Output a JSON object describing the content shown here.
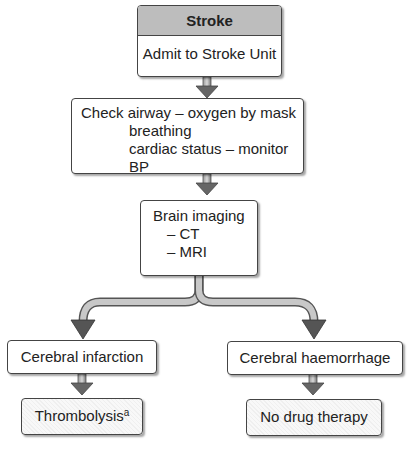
{
  "diagram": {
    "nodes": {
      "stroke": {
        "title": "Stroke",
        "subtitle": "Admit to Stroke Unit"
      },
      "check": {
        "line1": "Check airway – oxygen by mask",
        "line2": "breathing",
        "line3": "cardiac status – monitor BP"
      },
      "imaging": {
        "line1": "Brain imaging",
        "line2": "– CT",
        "line3": "– MRI"
      },
      "infarction": {
        "label": "Cerebral infarction"
      },
      "haemorrhage": {
        "label": "Cerebral haemorrhage"
      },
      "thrombolysis": {
        "label": "Thrombolysis",
        "superscript": "a"
      },
      "no_drug": {
        "label": "No drug therapy"
      }
    },
    "colors": {
      "header_fill": "#bdbdbd",
      "border": "#444444",
      "arrow": "#666666"
    }
  }
}
